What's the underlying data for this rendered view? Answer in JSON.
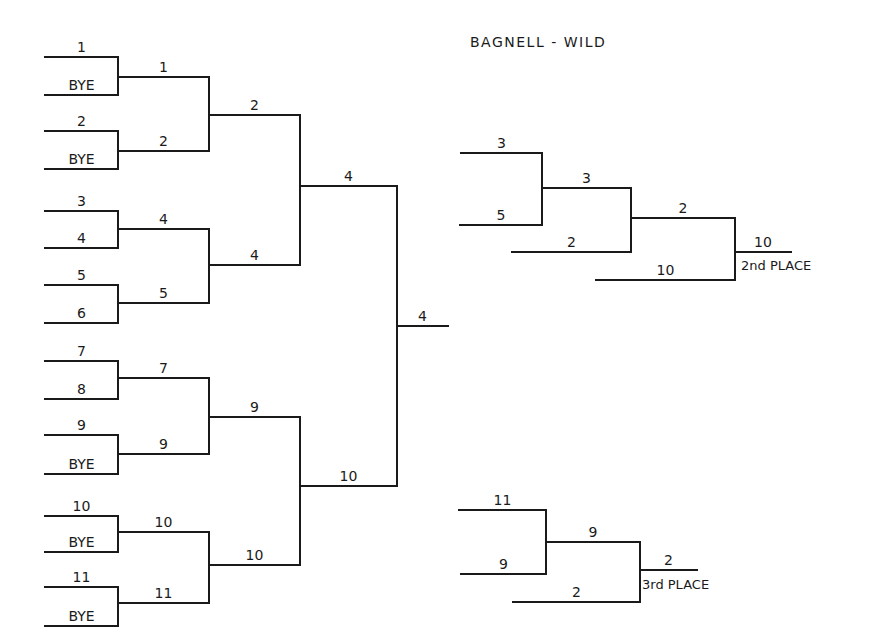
{
  "title": "BAGNELL - WILD",
  "colors": {
    "ink": "#1a1a1a",
    "background": "#ffffff"
  },
  "main_bracket": {
    "round1": [
      {
        "label": "1",
        "y": 57
      },
      {
        "label": "BYE",
        "y": 95
      },
      {
        "label": "2",
        "y": 131
      },
      {
        "label": "BYE",
        "y": 169
      },
      {
        "label": "3",
        "y": 211
      },
      {
        "label": "4",
        "y": 248
      },
      {
        "label": "5",
        "y": 285
      },
      {
        "label": "6",
        "y": 323
      },
      {
        "label": "7",
        "y": 361
      },
      {
        "label": "8",
        "y": 399
      },
      {
        "label": "9",
        "y": 435
      },
      {
        "label": "BYE",
        "y": 474
      },
      {
        "label": "10",
        "y": 516
      },
      {
        "label": "BYE",
        "y": 552
      },
      {
        "label": "11",
        "y": 587
      },
      {
        "label": "BYE",
        "y": 626
      }
    ],
    "round2": [
      {
        "label": "1",
        "y": 77
      },
      {
        "label": "2",
        "y": 151
      },
      {
        "label": "4",
        "y": 229
      },
      {
        "label": "5",
        "y": 303
      },
      {
        "label": "7",
        "y": 378
      },
      {
        "label": "9",
        "y": 454
      },
      {
        "label": "10",
        "y": 532
      },
      {
        "label": "11",
        "y": 603
      }
    ],
    "round3": [
      {
        "label": "2",
        "y": 115
      },
      {
        "label": "4",
        "y": 265
      },
      {
        "label": "9",
        "y": 417
      },
      {
        "label": "10",
        "y": 565
      }
    ],
    "round4": [
      {
        "label": "4",
        "y": 186
      },
      {
        "label": "10",
        "y": 486
      }
    ],
    "champion": {
      "label": "4",
      "y": 326
    },
    "x": {
      "r1_start": 45,
      "r1_end": 118,
      "r2_end": 209,
      "r3_end": 300,
      "r4_end": 397,
      "final_end": 448
    }
  },
  "second_place_bracket": {
    "entries": [
      {
        "label": "3",
        "x1": 461,
        "x2": 542,
        "y": 153
      },
      {
        "label": "5",
        "x1": 460,
        "x2": 542,
        "y": 225
      },
      {
        "label": "3",
        "x1": 542,
        "x2": 631,
        "y": 188
      },
      {
        "label": "2",
        "x1": 512,
        "x2": 631,
        "y": 252
      },
      {
        "label": "2",
        "x1": 631,
        "x2": 735,
        "y": 218
      },
      {
        "label": "10",
        "x1": 596,
        "x2": 735,
        "y": 280
      },
      {
        "label": "10",
        "x1": 735,
        "x2": 791,
        "y": 252
      }
    ],
    "verticals": [
      {
        "x": 542,
        "y1": 153,
        "y2": 225
      },
      {
        "x": 631,
        "y1": 188,
        "y2": 252
      },
      {
        "x": 735,
        "y1": 218,
        "y2": 280
      }
    ],
    "place_label": "2nd PLACE"
  },
  "third_place_bracket": {
    "entries": [
      {
        "label": "11",
        "x1": 459,
        "x2": 546,
        "y": 510
      },
      {
        "label": "9",
        "x1": 461,
        "x2": 546,
        "y": 574
      },
      {
        "label": "9",
        "x1": 546,
        "x2": 640,
        "y": 542
      },
      {
        "label": "2",
        "x1": 513,
        "x2": 640,
        "y": 602
      },
      {
        "label": "2",
        "x1": 640,
        "x2": 697,
        "y": 570
      }
    ],
    "verticals": [
      {
        "x": 546,
        "y1": 510,
        "y2": 574
      },
      {
        "x": 640,
        "y1": 542,
        "y2": 602
      }
    ],
    "place_label": "3rd PLACE"
  }
}
